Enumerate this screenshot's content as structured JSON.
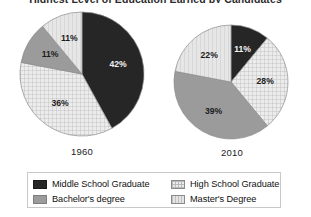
{
  "chart_data": {
    "type": "pie",
    "title": "Highest Level of Education Earned by Candidates",
    "xlabel": "",
    "ylabel": "",
    "legend_position": "bottom",
    "grid": false,
    "categories": [
      "Middle School Graduate",
      "High School Graduate",
      "Bachelor's degree",
      "Master's Degree"
    ],
    "colors": {
      "middle_school": "#262626",
      "high_school": "#ececec",
      "bachelors": "#9b9b9b",
      "masters": "#e4e4e4"
    },
    "series": [
      {
        "name": "1960",
        "values": [
          42,
          36,
          11,
          11
        ],
        "labels": [
          "42%",
          "36%",
          "11%",
          "11%"
        ]
      },
      {
        "name": "2010",
        "values": [
          11,
          28,
          39,
          22
        ],
        "labels": [
          "11%",
          "28%",
          "39%",
          "22%"
        ]
      }
    ]
  },
  "title": "Highest Level of Education Earned by Candidates",
  "pies": [
    {
      "year": "1960",
      "slices": [
        {
          "label": "42%",
          "value": 42,
          "category": "Middle School Graduate"
        },
        {
          "label": "36%",
          "value": 36,
          "category": "High School Graduate"
        },
        {
          "label": "11%",
          "value": 11,
          "category": "Bachelor's degree"
        },
        {
          "label": "11%",
          "value": 11,
          "category": "Master's Degree"
        }
      ]
    },
    {
      "year": "2010",
      "slices": [
        {
          "label": "11%",
          "value": 11,
          "category": "Middle School Graduate"
        },
        {
          "label": "28%",
          "value": 28,
          "category": "High School Graduate"
        },
        {
          "label": "39%",
          "value": 39,
          "category": "Bachelor's degree"
        },
        {
          "label": "22%",
          "value": 22,
          "category": "Master's Degree"
        }
      ]
    }
  ],
  "legend": {
    "left_column": [
      {
        "label": "Middle School Graduate",
        "swatch": "middle_school"
      },
      {
        "label": "Bachelor's degree",
        "swatch": "bachelors"
      }
    ],
    "right_column": [
      {
        "label": "High School Graduate",
        "swatch": "high_school"
      },
      {
        "label": "Master's Degree",
        "swatch": "masters"
      }
    ]
  }
}
